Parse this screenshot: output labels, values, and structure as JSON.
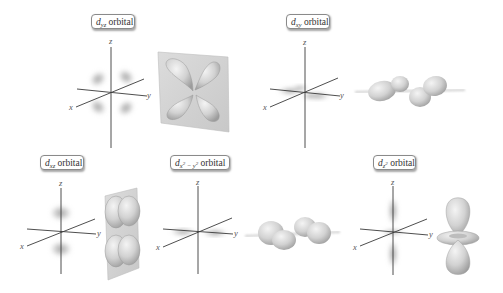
{
  "figure": {
    "panels": [
      {
        "id": "dyz",
        "label": {
          "letter": "d",
          "subscript": "yz",
          "suffix": " orbital"
        },
        "axes": {
          "x": "x",
          "y": "y",
          "z": "z"
        },
        "cloud_plane": "yz",
        "shape_3d": "four-lobe cloverleaf on shaded yz plane"
      },
      {
        "id": "dxy",
        "label": {
          "letter": "d",
          "subscript": "xy",
          "suffix": " orbital"
        },
        "axes": {
          "x": "x",
          "y": "y",
          "z": "z"
        },
        "cloud_plane": "xy",
        "shape_3d": "four lobes lying in xy plane"
      },
      {
        "id": "dxz",
        "label": {
          "letter": "d",
          "subscript": "xz",
          "suffix": " orbital"
        },
        "axes": {
          "x": "x",
          "y": "y",
          "z": "z"
        },
        "cloud_plane": "xz",
        "shape_3d": "four lobes on shaded xz plane"
      },
      {
        "id": "dx2y2",
        "label": {
          "letter": "d",
          "subscript_a": "x",
          "sup_a": "2",
          "minus": " − ",
          "subscript_b": "y",
          "sup_b": "2",
          "suffix": " orbital"
        },
        "axes": {
          "x": "x",
          "y": "y",
          "z": "z"
        },
        "cloud_plane": "xy (along axes)",
        "shape_3d": "four lobes along x and y axes"
      },
      {
        "id": "dz2",
        "label": {
          "letter": "d",
          "subscript": "z",
          "sup": "2",
          "suffix": " orbital"
        },
        "axes": {
          "x": "x",
          "y": "y",
          "z": "z"
        },
        "cloud_plane": "z axis with torus",
        "shape_3d": "two lobes along z with torus ring"
      }
    ],
    "colors": {
      "axis": "#3a3a3a",
      "cloud": "#9a9a9a",
      "lobe_fill": "#d6d6d6",
      "lobe_shadow": "#a8a8a8",
      "plane": "#cfcfcf",
      "label_border": "#8a8a8a"
    }
  }
}
